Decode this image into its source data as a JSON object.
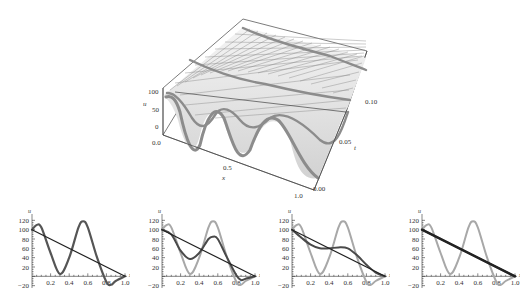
{
  "chart_data": [
    {
      "type": "surface3d",
      "title": "",
      "xlabel": "x",
      "ylabel": "t",
      "zlabel": "u",
      "x_ticks": [
        "0.0",
        "0.5",
        "1.0"
      ],
      "t_ticks": [
        "0.00",
        "0.05",
        "0.10"
      ],
      "u_ticks": [
        "0",
        "50",
        "100"
      ],
      "xlim": [
        0,
        1
      ],
      "tlim": [
        0,
        0.1
      ],
      "zlim": [
        -20,
        120
      ],
      "initial_profile": "u(x,0) oscillating: ~100 at x=0, peak ~110 near x=0.05, min ~5 near x=0.3, peak ~118 near x=0.55, min ~-18 near x=0.85, 0 at x=1",
      "steady_state": "linear from 100 at x=0 to 0 at x=1"
    },
    {
      "type": "line",
      "xlabel": "x",
      "ylabel": "u",
      "x_ticks": [
        "0.2",
        "0.4",
        "0.6",
        "0.8",
        "1.0"
      ],
      "y_ticks": [
        "-20",
        "20",
        "40",
        "60",
        "80",
        "100",
        "120"
      ],
      "xlim": [
        0,
        1
      ],
      "ylim": [
        -25,
        125
      ],
      "series": [
        {
          "name": "u(x,0)",
          "x": [
            0,
            0.05,
            0.1,
            0.2,
            0.3,
            0.4,
            0.5,
            0.55,
            0.6,
            0.7,
            0.8,
            0.85,
            0.9,
            1.0
          ],
          "values": [
            100,
            110,
            105,
            50,
            5,
            40,
            105,
            118,
            105,
            40,
            -12,
            -18,
            -10,
            0
          ]
        },
        {
          "name": "steady",
          "x": [
            0,
            1
          ],
          "values": [
            100,
            0
          ]
        }
      ]
    },
    {
      "type": "line",
      "xlabel": "x",
      "ylabel": "u",
      "x_ticks": [
        "0.2",
        "0.4",
        "0.6",
        "0.8",
        "1.0"
      ],
      "y_ticks": [
        "-20",
        "20",
        "40",
        "60",
        "80",
        "100",
        "120"
      ],
      "xlim": [
        0,
        1
      ],
      "ylim": [
        -25,
        125
      ],
      "series": [
        {
          "name": "u(x,0)",
          "x": [
            0,
            0.05,
            0.1,
            0.2,
            0.3,
            0.4,
            0.5,
            0.55,
            0.6,
            0.7,
            0.8,
            0.85,
            0.9,
            1.0
          ],
          "values": [
            100,
            110,
            105,
            50,
            5,
            40,
            105,
            118,
            105,
            40,
            -12,
            -18,
            -10,
            0
          ]
        },
        {
          "name": "u(x,t1)",
          "x": [
            0,
            0.1,
            0.2,
            0.3,
            0.4,
            0.5,
            0.55,
            0.6,
            0.7,
            0.8,
            0.85,
            0.9,
            1.0
          ],
          "values": [
            100,
            90,
            55,
            37,
            50,
            80,
            85,
            80,
            40,
            2,
            -8,
            -5,
            0
          ]
        },
        {
          "name": "steady",
          "x": [
            0,
            1
          ],
          "values": [
            100,
            0
          ]
        }
      ]
    },
    {
      "type": "line",
      "xlabel": "x",
      "ylabel": "u",
      "x_ticks": [
        "0.2",
        "0.4",
        "0.6",
        "0.8",
        "1.0"
      ],
      "y_ticks": [
        "-20",
        "20",
        "40",
        "60",
        "80",
        "100",
        "120"
      ],
      "xlim": [
        0,
        1
      ],
      "ylim": [
        -25,
        125
      ],
      "series": [
        {
          "name": "u(x,0)",
          "x": [
            0,
            0.05,
            0.1,
            0.2,
            0.3,
            0.4,
            0.5,
            0.55,
            0.6,
            0.7,
            0.8,
            0.85,
            0.9,
            1.0
          ],
          "values": [
            100,
            110,
            105,
            50,
            5,
            40,
            105,
            118,
            105,
            40,
            -12,
            -18,
            -10,
            0
          ]
        },
        {
          "name": "u(x,t2)",
          "x": [
            0,
            0.1,
            0.2,
            0.3,
            0.4,
            0.5,
            0.6,
            0.7,
            0.8,
            0.9,
            1.0
          ],
          "values": [
            100,
            83,
            68,
            60,
            60,
            62,
            60,
            45,
            25,
            8,
            0
          ]
        },
        {
          "name": "steady",
          "x": [
            0,
            1
          ],
          "values": [
            100,
            0
          ]
        }
      ]
    },
    {
      "type": "line",
      "xlabel": "x",
      "ylabel": "u",
      "x_ticks": [
        "0.2",
        "0.4",
        "0.6",
        "0.8",
        "1.0"
      ],
      "y_ticks": [
        "-20",
        "20",
        "40",
        "60",
        "80",
        "100",
        "120"
      ],
      "xlim": [
        0,
        1
      ],
      "ylim": [
        -25,
        125
      ],
      "series": [
        {
          "name": "u(x,0)",
          "x": [
            0,
            0.05,
            0.1,
            0.2,
            0.3,
            0.4,
            0.5,
            0.55,
            0.6,
            0.7,
            0.8,
            0.85,
            0.9,
            1.0
          ],
          "values": [
            100,
            110,
            105,
            50,
            5,
            40,
            105,
            118,
            105,
            40,
            -12,
            -18,
            -10,
            0
          ]
        },
        {
          "name": "u(x,t3)",
          "x": [
            0,
            1
          ],
          "values": [
            100,
            0
          ]
        },
        {
          "name": "steady",
          "x": [
            0,
            1
          ],
          "values": [
            100,
            0
          ]
        }
      ]
    }
  ],
  "labels": {
    "surf_u": "u",
    "surf_x": "x",
    "surf_t": "t",
    "surf_u0": "0",
    "surf_u50": "50",
    "surf_u100": "100",
    "surf_x0": "0.0",
    "surf_x05": "0.5",
    "surf_x1": "1.0",
    "surf_t0": "0.00",
    "surf_t05": "0.05",
    "surf_t10": "0.10",
    "u": "u",
    "x": "x",
    "y120": "120",
    "y100": "100",
    "y80": "80",
    "y60": "60",
    "y40": "40",
    "y20": "20",
    "ym20": "−20",
    "x02": "0.2",
    "x04": "0.4",
    "x06": "0.6",
    "x08": "0.8",
    "x10": "1.0"
  }
}
